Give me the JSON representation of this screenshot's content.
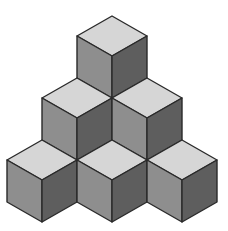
{
  "diagram": {
    "type": "isometric-cube-stack",
    "rows": [
      1,
      2,
      3
    ],
    "cube_count": 6,
    "colors": {
      "top": "#d6d6d6",
      "left": "#8e8e8e",
      "right": "#5e5e5e",
      "edge": "#2a2a2a",
      "background": "#ffffff"
    }
  }
}
